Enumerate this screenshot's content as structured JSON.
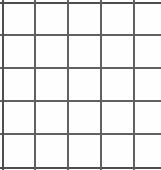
{
  "figure": {
    "kind": "grid",
    "rows": 5,
    "columns": 5,
    "line_color": "#5a5a5a",
    "border_color": "#4e4e4e",
    "interior_line_color": "#616161",
    "cell_fill": "#fefefe",
    "background": "#ffffff",
    "line_width_px": 2,
    "cell_pitch_px": 33,
    "clipped_right_edge": true
  },
  "geometry": {
    "width": 161,
    "height": 170,
    "vertical_line_x": [
      2,
      34,
      67,
      100,
      133
    ],
    "horizontal_line_y": [
      2,
      34,
      67,
      100,
      133,
      167
    ]
  },
  "cells": [
    [
      "",
      "",
      "",
      "",
      ""
    ],
    [
      "",
      "",
      "",
      "",
      ""
    ],
    [
      "",
      "",
      "",
      "",
      ""
    ],
    [
      "",
      "",
      "",
      "",
      ""
    ],
    [
      "",
      "",
      "",
      "",
      ""
    ]
  ]
}
